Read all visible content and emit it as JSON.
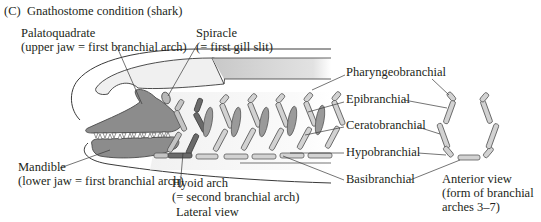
{
  "figure": {
    "panel_letter": "(C)",
    "title": "Gnathostome condition (shark)"
  },
  "labels": {
    "palatoquadrate": {
      "line1": "Palatoquadrate",
      "line2": "(upper jaw = first branchial arch)"
    },
    "spiracle": {
      "line1": "Spiracle",
      "line2": "(= first gill slit)"
    },
    "mandible": {
      "line1": "Mandible",
      "line2": "(lower jaw = first branchial arch)"
    },
    "hyoid": {
      "line1": "Hyoid arch",
      "line2": "(= second branchial arch)"
    },
    "lateral_view": "Lateral view",
    "pharyngeobranchial": "Pharyngeobranchial",
    "epibranchial": "Epibranchial",
    "ceratobranchial": "Ceratobranchial",
    "hypobranchial": "Hypobranchial",
    "basibranchial": "Basibranchial",
    "anterior_view": {
      "line1": "Anterior view",
      "line2": "(form of branchial",
      "line3": "arches 3–7)"
    }
  },
  "colors": {
    "jaw": "#8c8c8c",
    "jaw_dark": "#6e6e6e",
    "hyoid": "#7a7a7a",
    "arch": "#d2d2d2",
    "arch_stroke": "#5a5a5a",
    "gill_bar": "#9a9a9a",
    "outline": "#3a3a3a",
    "body_fill": "#f4f4f4"
  }
}
